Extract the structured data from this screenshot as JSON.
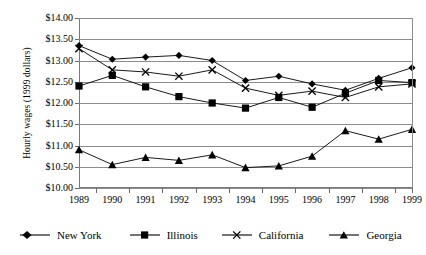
{
  "chart_data": {
    "type": "line",
    "title": "",
    "xlabel": "",
    "ylabel": "Hourly wages (1999 dollars)",
    "categories": [
      "1989",
      "1990",
      "1991",
      "1992",
      "1993",
      "1994",
      "1995",
      "1996",
      "1997",
      "1998",
      "1999"
    ],
    "ylim": [
      10.0,
      14.0
    ],
    "ytick_values": [
      10.0,
      10.5,
      11.0,
      11.5,
      12.0,
      12.5,
      13.0,
      13.5,
      14.0
    ],
    "ytick_labels": [
      "$10.00",
      "$10.50",
      "$11.00",
      "$11.50",
      "$12.00",
      "$12.50",
      "$13.00",
      "$13.50",
      "$14.00"
    ],
    "grid": true,
    "legend_position": "bottom",
    "series": [
      {
        "name": "New York",
        "marker": "diamond",
        "values": [
          13.35,
          13.03,
          13.08,
          13.12,
          13.0,
          12.53,
          12.63,
          12.45,
          12.3,
          12.58,
          12.83
        ]
      },
      {
        "name": "Illinois",
        "marker": "square",
        "values": [
          12.4,
          12.65,
          12.38,
          12.15,
          12.0,
          11.88,
          12.13,
          11.9,
          12.23,
          12.53,
          12.48
        ]
      },
      {
        "name": "California",
        "marker": "cross",
        "values": [
          13.28,
          12.78,
          12.73,
          12.63,
          12.78,
          12.35,
          12.18,
          12.28,
          12.13,
          12.38,
          12.45
        ]
      },
      {
        "name": "Georgia",
        "marker": "triangle",
        "values": [
          10.9,
          10.55,
          10.72,
          10.65,
          10.78,
          10.48,
          10.52,
          10.75,
          11.35,
          11.15,
          11.38
        ]
      }
    ]
  },
  "legend": {
    "items": [
      {
        "label": "New York"
      },
      {
        "label": "Illinois"
      },
      {
        "label": "California"
      },
      {
        "label": "Georgia"
      }
    ]
  },
  "colors": {
    "series_line": "#000000",
    "grid": "#8c8c8c",
    "axis": "#6b6b6b",
    "background": "#ffffff"
  }
}
